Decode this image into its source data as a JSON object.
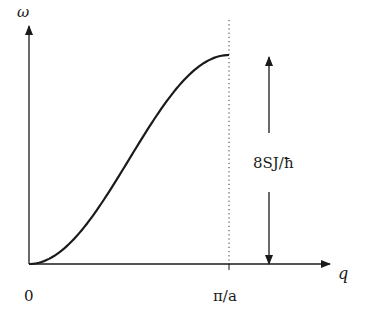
{
  "chart_data": {
    "type": "line",
    "title": "",
    "xlabel": "q",
    "ylabel": "ω",
    "x_ticks": [
      {
        "value": 0,
        "label": "0"
      },
      {
        "value": 3.14159,
        "label": "π/a"
      }
    ],
    "annotation": {
      "text": "8SJ/ħ",
      "meaning": "double-headed arrow spanning from ω = 0 to maximum ω at q = π/a"
    },
    "reference_line": {
      "x": "π/a",
      "style": "dotted",
      "orientation": "vertical"
    },
    "series": [
      {
        "name": "ω(q)",
        "formula": "ω = (8SJ/ħ)·sin²(qa/2)",
        "x_normalized": [
          0,
          0.1,
          0.2,
          0.3,
          0.4,
          0.5,
          0.6,
          0.7,
          0.8,
          0.9,
          1.0
        ],
        "y_normalized": [
          0,
          0.024,
          0.095,
          0.206,
          0.345,
          0.5,
          0.655,
          0.794,
          0.905,
          0.976,
          1.0
        ]
      }
    ],
    "xlim": [
      0,
      "π/a (+ extension)"
    ],
    "ylim": [
      0,
      "8SJ/ħ (+ extension)"
    ],
    "grid": false,
    "legend": null
  },
  "labels": {
    "y_axis": "ω",
    "x_axis": "q",
    "origin": "0",
    "x_max": "π/a",
    "amplitude": "8SJ/ħ"
  },
  "colors": {
    "line": "#1a1a1a",
    "background": "#ffffff"
  }
}
